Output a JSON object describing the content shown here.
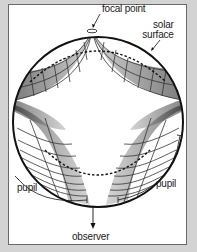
{
  "diagram": {
    "labels": {
      "focal_point": "focal point",
      "solar_surface_line1": "solar",
      "solar_surface_line2": "surface",
      "pupil_left": "pupil",
      "pupil_right": "pupil",
      "observer": "observer"
    },
    "colors": {
      "background": "#d3d3d3",
      "panel": "#ffffff",
      "panel_border": "#6a6a6a",
      "ink": "#111111",
      "ray_shade": "#555555"
    },
    "elements": [
      "sun-circle",
      "focal-point-marker",
      "ray-bundles-upper-left",
      "ray-bundles-upper-right",
      "ray-bundles-lower-left",
      "ray-bundles-lower-right",
      "dashed-upper-arc",
      "dashed-lower-arc",
      "pupil-arc-left",
      "pupil-arc-right",
      "observer-arrow"
    ]
  }
}
